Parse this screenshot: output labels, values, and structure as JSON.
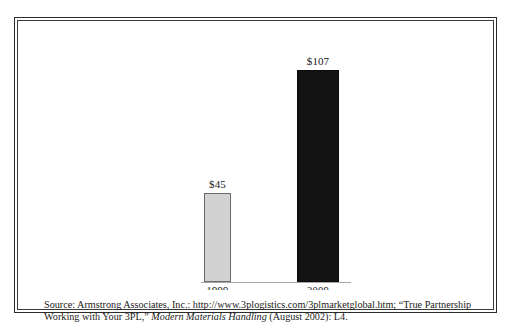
{
  "chart_data": {
    "type": "bar",
    "title": "",
    "subtitle": "",
    "xlabel": "",
    "ylabel": "",
    "categories": [
      "1999",
      "2009"
    ],
    "values": [
      45,
      107
    ],
    "value_labels": [
      "$45",
      "$107"
    ],
    "units": "US$ billions",
    "ylim": [
      0,
      107
    ],
    "grid": false,
    "legend": null,
    "series": [
      {
        "name": "Global 3PL market",
        "values": [
          45,
          107
        ],
        "point_colors": [
          "#d2d2d2",
          "#131313"
        ]
      }
    ],
    "colors": {
      "bar_1999_fill": "#d2d2d2",
      "bar_1999_border": "#6b6b6b",
      "bar_2009_fill": "#131313",
      "bar_2009_border": "#0b0b0b",
      "axis_line": "#a8a8a8",
      "frame": "#2b2b2b",
      "text": "#1a1a1a",
      "background": "#ffffff"
    }
  },
  "source": {
    "line1_prefix": "Source: Armstrong Associates, Inc.: http://www.3plogistics.com/3plmarketglobal.htm; “True Partnership",
    "line2_prefix": "Working with Your 3PL,” ",
    "line2_italic": "Modern Materials Handling",
    "line2_suffix": " (August 2002): L4."
  }
}
